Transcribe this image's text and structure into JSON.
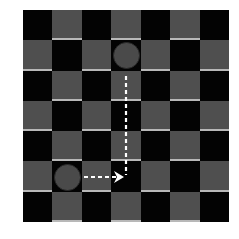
{
  "board": {
    "rows": 7,
    "cols": 7,
    "top_left_color": "dark",
    "colors": {
      "dark": "#030303",
      "light": "#4f4f4f",
      "light_edge": "#b8b8b8",
      "piece": "#4a4a4a",
      "path": "#ffffff"
    }
  },
  "pieces": [
    {
      "name": "piece-top",
      "row": 1,
      "col": 3
    },
    {
      "name": "piece-bottom",
      "row": 5,
      "col": 1
    }
  ],
  "path": {
    "style": "dashed",
    "segments": [
      {
        "from": [
          126,
          76
        ],
        "to": [
          126,
          175
        ]
      },
      {
        "from": [
          84,
          177
        ],
        "to": [
          117,
          177
        ]
      }
    ],
    "arrowhead": {
      "direction": "right",
      "tip": [
        124,
        177
      ]
    }
  }
}
